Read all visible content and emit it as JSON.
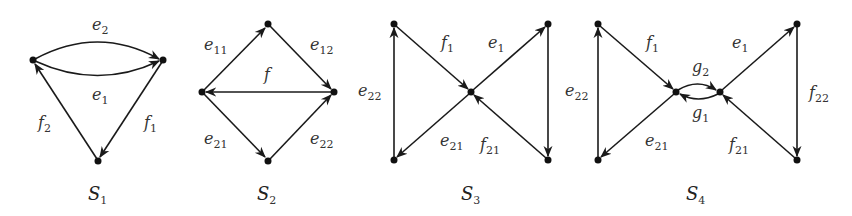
{
  "figure": {
    "colors": {
      "edge": "#1a1a1a",
      "node": "#111111",
      "label": "#333333",
      "background": "#ffffff"
    },
    "diagrams": [
      {
        "caption": {
          "main": "S",
          "sub": "1"
        },
        "nodes": [
          [
            33,
            60
          ],
          [
            163,
            60
          ],
          [
            98,
            161
          ]
        ],
        "edges": [
          {
            "label": "e",
            "sub": "2",
            "desc": "upper arc, left to right"
          },
          {
            "label": "e",
            "sub": "1",
            "desc": "lower arc, left to right"
          },
          {
            "label": "f",
            "sub": "1",
            "desc": "right node to bottom node"
          },
          {
            "label": "f",
            "sub": "2",
            "desc": "bottom node to left node"
          }
        ]
      },
      {
        "caption": {
          "main": "S",
          "sub": "2"
        },
        "nodes": [
          [
            268,
            24
          ],
          [
            202,
            92
          ],
          [
            334,
            92
          ],
          [
            268,
            161
          ]
        ],
        "edges": [
          {
            "label": "e",
            "sub": "11",
            "desc": "left to top"
          },
          {
            "label": "e",
            "sub": "12",
            "desc": "top to right"
          },
          {
            "label": "f",
            "sub": "",
            "desc": "right to left"
          },
          {
            "label": "e",
            "sub": "21",
            "desc": "left to bottom"
          },
          {
            "label": "e",
            "sub": "22",
            "desc": "bottom to right"
          }
        ]
      },
      {
        "caption": {
          "main": "S",
          "sub": "3"
        },
        "nodes": [
          [
            394,
            24
          ],
          [
            548,
            24
          ],
          [
            471,
            92
          ],
          [
            394,
            160
          ],
          [
            548,
            160
          ]
        ],
        "edges": [
          {
            "label": "f",
            "sub": "1",
            "desc": "top-left to center"
          },
          {
            "label": "e",
            "sub": "1",
            "desc": "center to top-right"
          },
          {
            "label": "e",
            "sub": "22",
            "desc": "top-right to bottom-right"
          },
          {
            "label": "f",
            "sub": "21",
            "desc": "bottom-right to center"
          },
          {
            "label": "e",
            "sub": "21",
            "desc": "center to bottom-left"
          },
          {
            "label": "e",
            "sub": "22",
            "desc": "bottom-left to top-left"
          }
        ]
      },
      {
        "caption": {
          "main": "S",
          "sub": "4"
        },
        "nodes": [
          [
            598,
            24
          ],
          [
            797,
            24
          ],
          [
            676,
            92
          ],
          [
            720,
            92
          ],
          [
            598,
            160
          ],
          [
            797,
            160
          ]
        ],
        "edges": [
          {
            "label": "f",
            "sub": "1",
            "desc": "top-left to center-left"
          },
          {
            "label": "g",
            "sub": "2",
            "desc": "upper arc center-left to center-right"
          },
          {
            "label": "g",
            "sub": "1",
            "desc": "lower arc center-right to center-left"
          },
          {
            "label": "e",
            "sub": "1",
            "desc": "center-right to top-right"
          },
          {
            "label": "f",
            "sub": "22",
            "desc": "top-right to bottom-right"
          },
          {
            "label": "f",
            "sub": "21",
            "desc": "bottom-right to center-right"
          },
          {
            "label": "e",
            "sub": "21",
            "desc": "center-left to bottom-left"
          },
          {
            "label": "e",
            "sub": "22",
            "desc": "bottom-left to top-left"
          }
        ]
      }
    ]
  }
}
